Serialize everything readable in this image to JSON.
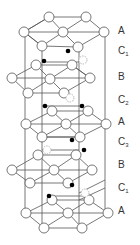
{
  "diagram": {
    "layer_labels": [
      {
        "text": "A",
        "sub": "",
        "y": 31
      },
      {
        "text": "C",
        "sub": "1",
        "y": 52
      },
      {
        "text": "B",
        "sub": "",
        "y": 77
      },
      {
        "text": "C",
        "sub": "2",
        "y": 100
      },
      {
        "text": "A",
        "sub": "",
        "y": 122
      },
      {
        "text": "C",
        "sub": "3",
        "y": 142
      },
      {
        "text": "B",
        "sub": "",
        "y": 165
      },
      {
        "text": "C",
        "sub": "1",
        "y": 188
      },
      {
        "text": "A",
        "sub": "",
        "y": 211
      }
    ],
    "colors": {
      "line": "#555555",
      "atom_fill": "#ffffff",
      "dot": "#000000"
    }
  }
}
